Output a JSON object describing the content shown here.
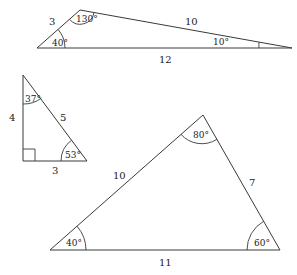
{
  "diagram": {
    "triangles": [
      {
        "id": "obtuse-triangle",
        "sides": [
          {
            "label": "3",
            "between": "bottom-left and top"
          },
          {
            "label": "10",
            "between": "top and right"
          },
          {
            "label": "12",
            "between": "bottom-left and right"
          }
        ],
        "angles": [
          {
            "label": "40°",
            "vertex": "bottom-left"
          },
          {
            "label": "130°",
            "vertex": "top"
          },
          {
            "label": "10°",
            "vertex": "right"
          }
        ]
      },
      {
        "id": "right-triangle",
        "sides": [
          {
            "label": "4",
            "between": "top and bottom-left"
          },
          {
            "label": "5",
            "between": "top and bottom-right"
          },
          {
            "label": "3",
            "between": "bottom-left and bottom-right"
          }
        ],
        "angles": [
          {
            "label": "37°",
            "vertex": "top"
          },
          {
            "label": "53°",
            "vertex": "bottom-right"
          },
          {
            "label": "right-angle",
            "vertex": "bottom-left"
          }
        ]
      },
      {
        "id": "acute-triangle",
        "sides": [
          {
            "label": "10",
            "between": "bottom-left and top"
          },
          {
            "label": "7",
            "between": "top and bottom-right"
          },
          {
            "label": "11",
            "between": "bottom-left and bottom-right"
          }
        ],
        "angles": [
          {
            "label": "40°",
            "vertex": "bottom-left"
          },
          {
            "label": "80°",
            "vertex": "top"
          },
          {
            "label": "60°",
            "vertex": "bottom-right"
          }
        ]
      }
    ]
  }
}
